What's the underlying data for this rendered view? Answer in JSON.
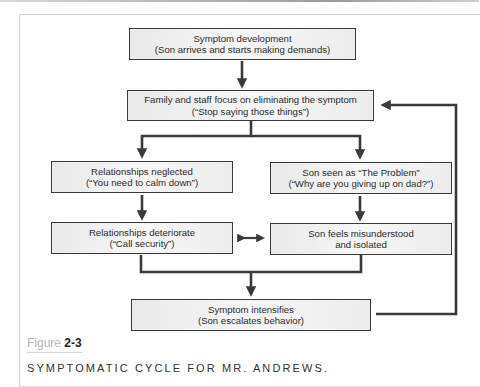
{
  "figure": {
    "label_word": "Figure",
    "label_number": "2-3",
    "caption": "SYMPTOMATIC CYCLE FOR MR. ANDREWS."
  },
  "boxes": {
    "symptom_development": {
      "line1": "Symptom development",
      "line2": "(Son arrives and starts making demands)"
    },
    "family_staff_focus": {
      "line1": "Family and staff focus on eliminating the symptom",
      "line2": "(“Stop saying those things”)"
    },
    "relationships_neglected": {
      "line1": "Relationships neglected",
      "line2": "(“You need to calm down”)"
    },
    "son_seen_as_problem": {
      "line1": "Son seen as “The Problem”",
      "line2": "(“Why are you giving up on dad?”)"
    },
    "relationships_deteriorate": {
      "line1": "Relationships deteriorate",
      "line2": "(“Call security”)"
    },
    "son_feels_misunderstood": {
      "line1": "Son feels misunderstood",
      "line2": "and isolated"
    },
    "symptom_intensifies": {
      "line1": "Symptom intensifies",
      "line2": "(Son escalates behavior)"
    }
  },
  "colors": {
    "line": "#3a3a3a",
    "box_fill": "#efefef",
    "figure_word": "#b9b9b9"
  }
}
